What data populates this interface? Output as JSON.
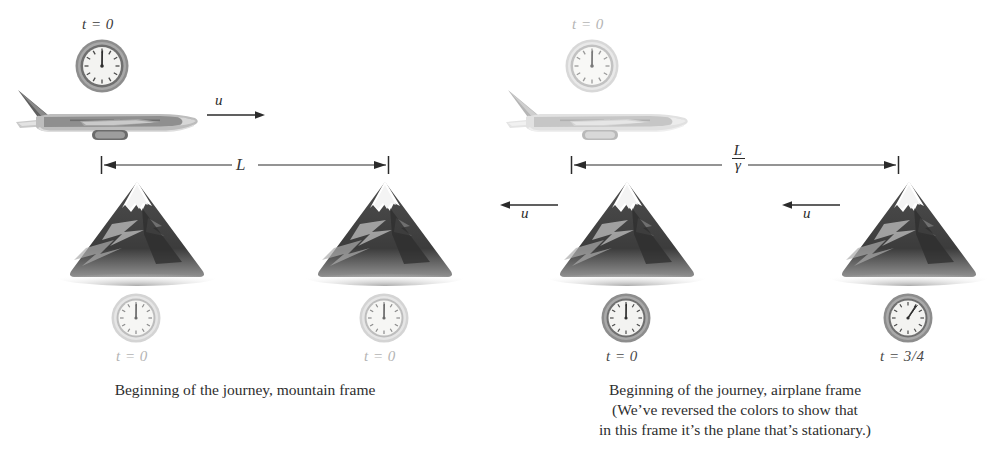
{
  "figure": {
    "background": "#ffffff"
  },
  "colors": {
    "ink": "#2b2b2b",
    "dark_gray": "#555555",
    "light_gray": "#b4b4b4",
    "mountain_dark": "#3f3f3f",
    "mountain_light": "#c9c9c9",
    "snow": "#ffffff",
    "clock_bezel_dark": "#7d7d7d",
    "clock_bezel_light": "#cfcfcf",
    "clock_face": "#f2f2f0"
  },
  "panels": [
    {
      "id": "mountain-frame",
      "caption_lines": [
        "Beginning of the journey, mountain frame"
      ],
      "plane": {
        "style": "dark",
        "velocity_label": "u",
        "velocity_direction": "right"
      },
      "top_clock": {
        "label": "t = 0",
        "style": "dark",
        "hand_hour": 12,
        "hand_minute": 0
      },
      "measure": {
        "label": "L",
        "is_fraction": false,
        "numerator": "L",
        "denominator": ""
      },
      "mountains": [
        {
          "style": "dark",
          "clock": {
            "label": "t = 0",
            "style": "light",
            "hand_hour": 12,
            "hand_minute": 0
          },
          "velocity_label": "",
          "velocity_direction": ""
        },
        {
          "style": "dark",
          "clock": {
            "label": "t = 0",
            "style": "light",
            "hand_hour": 12,
            "hand_minute": 0
          },
          "velocity_label": "",
          "velocity_direction": ""
        }
      ]
    },
    {
      "id": "airplane-frame",
      "caption_lines": [
        "Beginning of the journey, airplane frame",
        "(We’ve reversed the colors to show that",
        "in this frame it’s the plane that’s stationary.)"
      ],
      "plane": {
        "style": "light",
        "velocity_label": "",
        "velocity_direction": ""
      },
      "top_clock": {
        "label": "t = 0",
        "style": "light",
        "hand_hour": 12,
        "hand_minute": 0
      },
      "measure": {
        "label": "L/γ",
        "is_fraction": true,
        "numerator": "L",
        "denominator": "γ"
      },
      "mountains": [
        {
          "style": "dark",
          "clock": {
            "label": "t = 0",
            "style": "dark",
            "hand_hour": 12,
            "hand_minute": 0
          },
          "velocity_label": "u",
          "velocity_direction": "left"
        },
        {
          "style": "dark",
          "clock": {
            "label": "t = 3/4",
            "style": "dark",
            "hand_hour": 1,
            "hand_minute": 0
          },
          "velocity_label": "u",
          "velocity_direction": "left"
        }
      ]
    }
  ]
}
